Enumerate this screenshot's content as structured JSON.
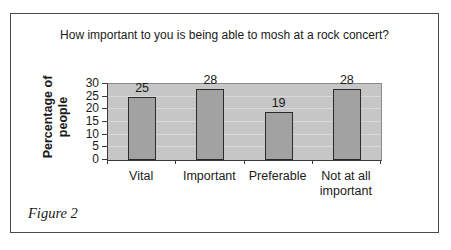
{
  "figure": {
    "caption": "Figure 2"
  },
  "chart_data": {
    "type": "bar",
    "title": "How important to you is being able to mosh at a rock concert?",
    "categories": [
      "Vital",
      "Important",
      "Preferable",
      "Not at all important"
    ],
    "values": [
      25,
      28,
      19,
      28
    ],
    "data_labels": [
      "25",
      "28",
      "19",
      "28"
    ],
    "ylabel": "Percentage of people",
    "ylabel_lines": [
      "Percentage of",
      "people"
    ],
    "xlabel": "",
    "ylim": [
      0,
      30
    ],
    "yticks": [
      0,
      5,
      10,
      15,
      20,
      25,
      30
    ],
    "grid": true,
    "legend": "none",
    "colors": {
      "bar_fill": "#a2a2a2",
      "bar_border": "#2b2b2b",
      "plot_bg": "#c6c6c6",
      "gridline": "#d9d9d9",
      "axis_line": "#3a3a3a",
      "plot_border": "#8a8a8a",
      "frame_border": "#4a4a4a",
      "text": "#1a1a1a",
      "background": "#ffffff"
    }
  }
}
